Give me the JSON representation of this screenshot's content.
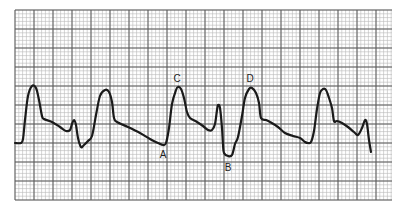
{
  "chart_data": {
    "type": "line",
    "title": "",
    "xlabel": "",
    "ylabel": "",
    "grid": true,
    "grid_px": {
      "left": 15,
      "top": 10,
      "right": 392,
      "bottom": 200,
      "major": 19,
      "minor": 3.8
    },
    "trace_px": [
      [
        15,
        143
      ],
      [
        21,
        143
      ],
      [
        23,
        139
      ],
      [
        25,
        120
      ],
      [
        28,
        96
      ],
      [
        32,
        86
      ],
      [
        36,
        88
      ],
      [
        39,
        100
      ],
      [
        42,
        116
      ],
      [
        44,
        119
      ],
      [
        52,
        122
      ],
      [
        60,
        127
      ],
      [
        66,
        131
      ],
      [
        70,
        130
      ],
      [
        72,
        124
      ],
      [
        74,
        120
      ],
      [
        76,
        125
      ],
      [
        78,
        138
      ],
      [
        81,
        147
      ],
      [
        84,
        145
      ],
      [
        88,
        141
      ],
      [
        92,
        136
      ],
      [
        96,
        115
      ],
      [
        100,
        96
      ],
      [
        105,
        90
      ],
      [
        109,
        92
      ],
      [
        112,
        102
      ],
      [
        114,
        118
      ],
      [
        117,
        122
      ],
      [
        128,
        127
      ],
      [
        140,
        133
      ],
      [
        150,
        139
      ],
      [
        158,
        143
      ],
      [
        163,
        145
      ],
      [
        166,
        143
      ],
      [
        169,
        128
      ],
      [
        172,
        104
      ],
      [
        176,
        90
      ],
      [
        178,
        87
      ],
      [
        181,
        89
      ],
      [
        184,
        98
      ],
      [
        187,
        112
      ],
      [
        190,
        118
      ],
      [
        197,
        122
      ],
      [
        203,
        126
      ],
      [
        208,
        130
      ],
      [
        212,
        130
      ],
      [
        215,
        124
      ],
      [
        217,
        110
      ],
      [
        218,
        105
      ],
      [
        220,
        108
      ],
      [
        222,
        128
      ],
      [
        223,
        145
      ],
      [
        224,
        153
      ],
      [
        228,
        156
      ],
      [
        232,
        155
      ],
      [
        235,
        144
      ],
      [
        238,
        137
      ],
      [
        242,
        116
      ],
      [
        245,
        98
      ],
      [
        249,
        89
      ],
      [
        252,
        88
      ],
      [
        256,
        93
      ],
      [
        259,
        103
      ],
      [
        261,
        118
      ],
      [
        266,
        120
      ],
      [
        270,
        122
      ],
      [
        278,
        127
      ],
      [
        285,
        133
      ],
      [
        293,
        136
      ],
      [
        300,
        138
      ],
      [
        305,
        142
      ],
      [
        308,
        143
      ],
      [
        311,
        142
      ],
      [
        314,
        131
      ],
      [
        317,
        109
      ],
      [
        320,
        93
      ],
      [
        323,
        89
      ],
      [
        326,
        90
      ],
      [
        329,
        98
      ],
      [
        332,
        108
      ],
      [
        334,
        121
      ],
      [
        337,
        121
      ],
      [
        342,
        123
      ],
      [
        348,
        127
      ],
      [
        354,
        132
      ],
      [
        358,
        135
      ],
      [
        362,
        128
      ],
      [
        365,
        120
      ],
      [
        367,
        124
      ],
      [
        369,
        140
      ],
      [
        371,
        152
      ]
    ],
    "annotations": [
      {
        "text": "C",
        "x": 177,
        "y": 82
      },
      {
        "text": "D",
        "x": 250,
        "y": 82
      },
      {
        "text": "A",
        "x": 163,
        "y": 158
      },
      {
        "text": "B",
        "x": 228,
        "y": 171
      }
    ],
    "colors": {
      "trace": "#1a1a1a",
      "major_grid": "#5a5a5a",
      "minor_grid": "#b8b8b8",
      "paper": "#ffffff"
    }
  }
}
